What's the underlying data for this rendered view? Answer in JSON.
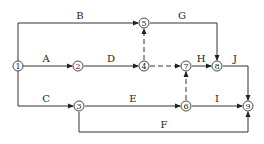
{
  "diagram": {
    "type": "activity-on-arrow network",
    "nodes": [
      {
        "id": "1",
        "label": "1",
        "x": 18,
        "y": 66
      },
      {
        "id": "2",
        "label": "2",
        "x": 78,
        "y": 66
      },
      {
        "id": "3",
        "label": "3",
        "x": 79,
        "y": 106
      },
      {
        "id": "4",
        "label": "4",
        "x": 144,
        "y": 66
      },
      {
        "id": "5",
        "label": "5",
        "x": 144,
        "y": 23
      },
      {
        "id": "6",
        "label": "6",
        "x": 186,
        "y": 106
      },
      {
        "id": "7",
        "label": "7",
        "x": 186,
        "y": 66
      },
      {
        "id": "8",
        "label": "8",
        "x": 217,
        "y": 66
      },
      {
        "id": "9",
        "label": "9",
        "x": 248,
        "y": 106
      }
    ],
    "edges": [
      {
        "id": "B",
        "label": "B",
        "from": "1",
        "to": "5",
        "dashed": false
      },
      {
        "id": "A",
        "label": "A",
        "from": "1",
        "to": "2",
        "dashed": false
      },
      {
        "id": "C",
        "label": "C",
        "from": "1",
        "to": "3",
        "dashed": false
      },
      {
        "id": "D",
        "label": "D",
        "from": "2",
        "to": "4",
        "dashed": false
      },
      {
        "id": "dummy-4-5",
        "label": "",
        "from": "4",
        "to": "5",
        "dashed": true
      },
      {
        "id": "dummy-4-7",
        "label": "",
        "from": "4",
        "to": "7",
        "dashed": true
      },
      {
        "id": "G",
        "label": "G",
        "from": "5",
        "to": "8",
        "dashed": false
      },
      {
        "id": "H",
        "label": "H",
        "from": "7",
        "to": "8",
        "dashed": false
      },
      {
        "id": "J",
        "label": "J",
        "from": "8",
        "to": "9",
        "dashed": false
      },
      {
        "id": "E",
        "label": "E",
        "from": "3",
        "to": "6",
        "dashed": false
      },
      {
        "id": "dummy-6-7",
        "label": "",
        "from": "6",
        "to": "7",
        "dashed": true
      },
      {
        "id": "I",
        "label": "I",
        "from": "6",
        "to": "9",
        "dashed": false
      },
      {
        "id": "F",
        "label": "F",
        "from": "3",
        "to": "9",
        "dashed": false
      }
    ]
  }
}
